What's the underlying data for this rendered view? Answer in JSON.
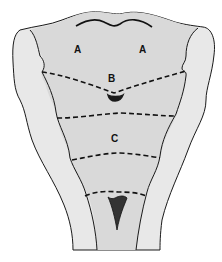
{
  "figure": {
    "type": "anatomical-diagram",
    "regions": [
      {
        "id": "A-left",
        "label": "A"
      },
      {
        "id": "A-right",
        "label": "A"
      },
      {
        "id": "B",
        "label": "B"
      },
      {
        "id": "C",
        "label": "C"
      }
    ],
    "colors": {
      "outer_fill": "#e6e6e6",
      "inner_fill": "#d9d9d9",
      "outline": "#1a1a1a",
      "dashes": "#1a1a1a",
      "dark_features": "#1e1e1e"
    }
  }
}
